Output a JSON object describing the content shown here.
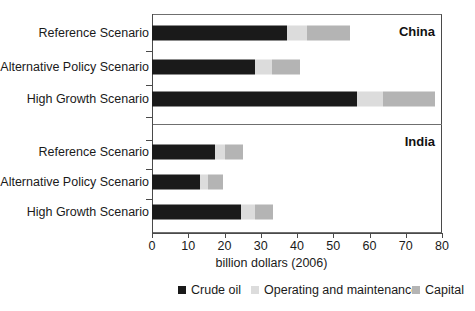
{
  "chart_data": {
    "type": "bar",
    "orientation": "horizontal",
    "stacked": true,
    "title": "",
    "xlabel": "billion dollars (2006)",
    "ylabel": "",
    "xlim": [
      0,
      80
    ],
    "xticks": [
      0,
      10,
      20,
      30,
      40,
      50,
      60,
      70,
      80
    ],
    "xtick_labels": [
      "0",
      "10",
      "20",
      "30",
      "40",
      "50",
      "60",
      "70",
      "80"
    ],
    "grid": false,
    "legend_position": "bottom",
    "series": [
      {
        "name": "Crude oil",
        "color": "#1a1a1a"
      },
      {
        "name": "Operating and maintenance",
        "color": "#dcdcdc"
      },
      {
        "name": "Capital",
        "color": "#b4b4b4"
      }
    ],
    "panels": [
      {
        "label": "China",
        "categories": [
          "Reference Scenario",
          "Alternative Policy Scenario",
          "High Growth Scenario"
        ],
        "values": {
          "Crude oil": [
            37.2,
            28.4,
            56.6
          ],
          "Operating and maintenance": [
            5.5,
            4.7,
            7.2
          ],
          "Capital": [
            11.9,
            7.7,
            14.3
          ]
        },
        "totals": [
          54.6,
          40.8,
          78.1
        ]
      },
      {
        "label": "India",
        "categories": [
          "Reference Scenario",
          "Alternative Policy Scenario",
          "High Growth Scenario"
        ],
        "values": {
          "Crude oil": [
            17.4,
            13.2,
            24.6
          ],
          "Operating and maintenance": [
            2.8,
            2.2,
            3.9
          ],
          "Capital": [
            5.0,
            4.1,
            5.0
          ]
        },
        "totals": [
          25.2,
          19.5,
          33.5
        ]
      }
    ]
  },
  "axis": {
    "x_title": "billion dollars (2006)",
    "ticks": [
      "0",
      "10",
      "20",
      "30",
      "40",
      "50",
      "60",
      "70",
      "80"
    ]
  },
  "panels": {
    "china": {
      "label": "China",
      "rows": [
        {
          "label": "Reference Scenario",
          "crude": 37.2,
          "om": 5.5,
          "capital": 11.9
        },
        {
          "label": "Alternative Policy Scenario",
          "crude": 28.4,
          "om": 4.7,
          "capital": 7.7
        },
        {
          "label": "High Growth Scenario",
          "crude": 56.6,
          "om": 7.2,
          "capital": 14.3
        }
      ]
    },
    "india": {
      "label": "India",
      "rows": [
        {
          "label": "Reference Scenario",
          "crude": 17.4,
          "om": 2.8,
          "capital": 5.0
        },
        {
          "label": "Alternative Policy Scenario",
          "crude": 13.2,
          "om": 2.2,
          "capital": 4.1
        },
        {
          "label": "High Growth Scenario",
          "crude": 24.6,
          "om": 3.9,
          "capital": 5.0
        }
      ]
    }
  },
  "legend": {
    "items": [
      {
        "label": "Crude oil",
        "color": "#1a1a1a"
      },
      {
        "label": "Operating and maintenance",
        "color": "#dcdcdc"
      },
      {
        "label": "Capital",
        "color": "#b4b4b4"
      }
    ]
  }
}
